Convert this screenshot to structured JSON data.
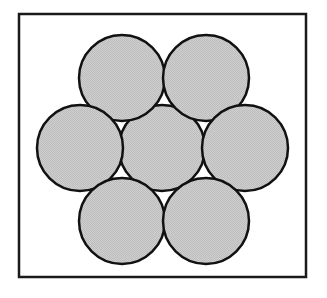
{
  "figure": {
    "canvas": {
      "width": 327,
      "height": 298,
      "background": "#ffffff"
    },
    "frame": {
      "name": "outer-rectangle-border",
      "x": 19,
      "y": 14,
      "width": 287,
      "height": 263,
      "stroke": "#1a1a1a",
      "stroke_width": 2.5,
      "fill": "#ffffff"
    },
    "circle_style": {
      "radius": 43,
      "fill": "#c9c9c9",
      "stroke": "#111111",
      "stroke_width": 2.5,
      "texture": "halftone-dither"
    },
    "circles": [
      {
        "id": "circle-center",
        "label": "center",
        "cx": 162,
        "cy": 148,
        "r": 43
      },
      {
        "id": "circle-top-left",
        "label": "top left",
        "cx": 122,
        "cy": 78,
        "r": 43
      },
      {
        "id": "circle-top-right",
        "label": "top right",
        "cx": 206,
        "cy": 78,
        "r": 43
      },
      {
        "id": "circle-middle-left",
        "label": "middle left",
        "cx": 80,
        "cy": 148,
        "r": 43
      },
      {
        "id": "circle-middle-right",
        "label": "middle right",
        "cx": 245,
        "cy": 148,
        "r": 43
      },
      {
        "id": "circle-bottom-left",
        "label": "bottom left",
        "cx": 122,
        "cy": 221,
        "r": 43
      },
      {
        "id": "circle-bottom-right",
        "label": "bottom right",
        "cx": 206,
        "cy": 221,
        "r": 43
      }
    ],
    "circle_count": 7
  }
}
